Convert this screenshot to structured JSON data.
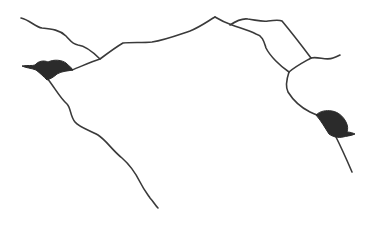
{
  "sketch": {
    "background": "#ffffff",
    "stroke_color": "#3a3a3a",
    "blob_color": "#2b2b2b",
    "lines": [
      {
        "name": "upper-left-branch",
        "d": "M21,18 C30,20 35,27 42,28 C52,29 60,30 66,36 C70,40 72,44 78,45 C86,46 94,53 100,59"
      },
      {
        "name": "left-blob-to-ridge",
        "d": "M72,70 C80,67 90,62 100,59 C108,53 116,47 123,43 C132,42 142,43 152,42 C165,40 178,35 190,31 C200,27 208,21 215,17"
      },
      {
        "name": "ridge-right-lower",
        "d": "M215,17 C220,20 226,23 232,25 C240,28 248,30 256,34 C263,36 264,42 266,48 C270,56 280,66 289,72"
      },
      {
        "name": "ridge-right-upper",
        "d": "M230,25 C236,21 242,18 248,19 C256,20 262,22 268,21 C275,20 280,20 282,21 C292,33 302,46 311,58"
      },
      {
        "name": "upper-right-spur",
        "d": "M311,58 C318,56 326,61 333,58 C336,57 338,56 340,55"
      },
      {
        "name": "cross-connector",
        "d": "M289,72 C296,66 304,62 311,58"
      },
      {
        "name": "right-descent",
        "d": "M289,72 C287,78 285,86 288,92 C293,100 300,107 310,112 C314,114 317,115 320,116"
      },
      {
        "name": "right-blob-tail",
        "d": "M335,135 C340,145 346,158 352,172"
      },
      {
        "name": "left-descent",
        "d": "M47,78 C55,88 60,98 67,104 C71,108 70,116 75,122 C80,128 90,130 98,135 C106,140 112,150 122,158 C130,165 135,172 140,182 C144,190 148,195 150,198 C153,201 155,205 158,208"
      }
    ],
    "blobs": [
      {
        "name": "left-blob",
        "d": "M22,66 C28,65 32,66 35,65 C38,61 44,60 48,62 C54,59 62,60 66,63 C69,66 72,68 73,70 C68,71 62,71 57,74 C54,77 50,79 47,80 C44,77 40,73 36,70 C31,68 26,68 22,66 Z"
      },
      {
        "name": "right-blob",
        "d": "M316,115 C320,111 326,110 332,111 C338,112 343,116 346,122 C348,126 348,129 347,132 C350,132 353,133 355,134 C351,136 346,136 343,137 C338,138 333,137 329,134 C325,128 322,122 316,115 Z"
      }
    ]
  }
}
